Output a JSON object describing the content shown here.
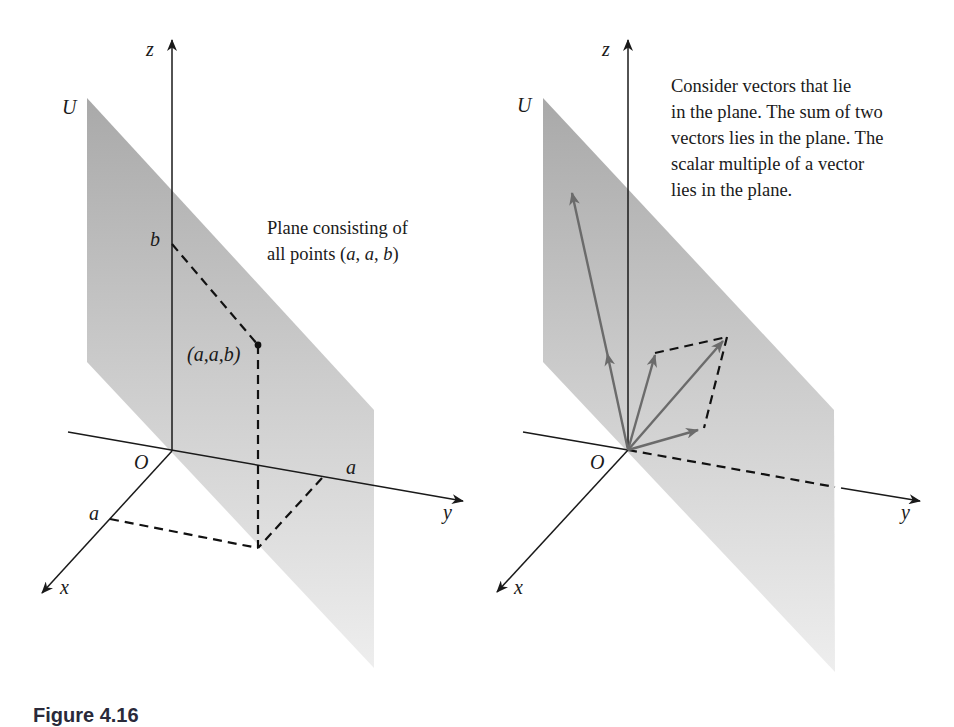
{
  "figure_caption": "Figure 4.16",
  "colors": {
    "plane_top": "#a9a9a9",
    "plane_mid": "#cdcdcd",
    "plane_bottom": "#eeeeee",
    "axis": "#1a1a1a",
    "vector": "#6b6b6b",
    "dashed": "#111111"
  },
  "left_figure": {
    "axes": {
      "z": "z",
      "y": "y",
      "x": "x",
      "origin": "O"
    },
    "plane_label": "U",
    "labels": {
      "b": "b",
      "a_on_x": "a",
      "a_on_y": "a",
      "point": "(a,a,b)"
    },
    "caption": {
      "line1": "Plane consisting of",
      "line2_prefix": "all points (",
      "line2_a1": "a",
      "line2_sep1": ", ",
      "line2_a2": "a",
      "line2_sep2": ", ",
      "line2_b": "b",
      "line2_suffix": ")"
    }
  },
  "right_figure": {
    "axes": {
      "z": "z",
      "y": "y",
      "x": "x",
      "origin": "O"
    },
    "plane_label": "U",
    "caption_lines": [
      "Consider vectors that lie",
      "in the plane. The sum of two",
      "vectors lies in the plane. The",
      "scalar multiple of a vector",
      "lies in the plane."
    ]
  }
}
